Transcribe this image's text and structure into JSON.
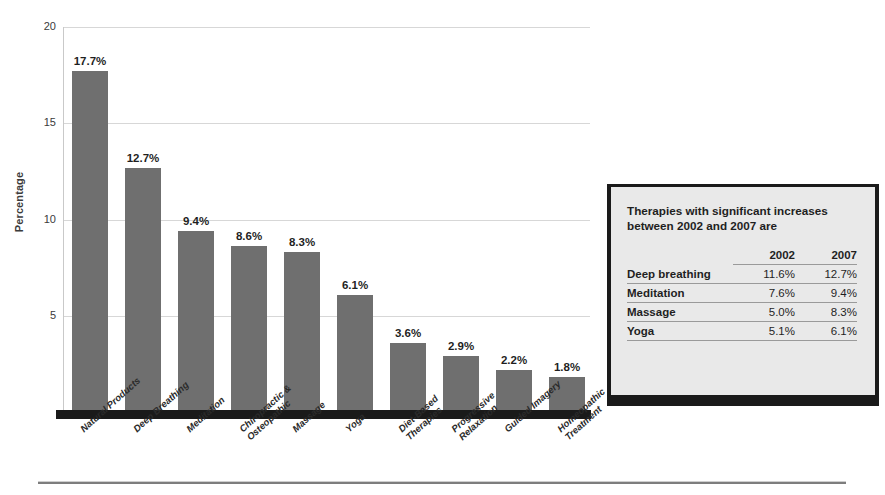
{
  "chart_data": {
    "type": "bar",
    "title": "",
    "xlabel": "",
    "ylabel": "Percentage",
    "ylim": [
      0,
      20
    ],
    "yticks": [
      5,
      10,
      15,
      20
    ],
    "grid": true,
    "legend": "none",
    "categories": [
      "Natural Products",
      "Deep Breathing",
      "Meditation",
      "Chiropractic &\nOsteopathic",
      "Massage",
      "Yoga",
      "Diet-Based\nTherapies",
      "Progressive\nRelaxation",
      "Guided Imagery",
      "Homeopathic\nTreatment"
    ],
    "values": [
      17.7,
      12.7,
      9.4,
      8.6,
      8.3,
      6.1,
      3.6,
      2.9,
      2.2,
      1.8
    ],
    "value_labels": [
      "17.7%",
      "12.7%",
      "9.4%",
      "8.6%",
      "8.3%",
      "6.1%",
      "3.6%",
      "2.9%",
      "2.2%",
      "1.8%"
    ],
    "bar_color": "#6f6f6f",
    "gridline_color": "#d7d7d7",
    "baseline_color": "#1a1a1a"
  },
  "axis": {
    "y_title": "Percentage",
    "ticks": [
      {
        "label": "20",
        "value": 20
      },
      {
        "label": "15",
        "value": 15
      },
      {
        "label": "10",
        "value": 10
      },
      {
        "label": "5",
        "value": 5
      }
    ]
  },
  "sidebox": {
    "title": "Therapies with significant increases between 2002 and 2007 are",
    "columns": [
      "",
      "2002",
      "2007"
    ],
    "rows": [
      {
        "name": "Deep breathing",
        "y2002": "11.6%",
        "y2007": "12.7%"
      },
      {
        "name": "Meditation",
        "y2002": "7.6%",
        "y2007": "9.4%"
      },
      {
        "name": "Massage",
        "y2002": "5.0%",
        "y2007": "8.3%"
      },
      {
        "name": "Yoga",
        "y2002": "5.1%",
        "y2007": "6.1%"
      }
    ],
    "background": "#e9e9e9",
    "border_color": "#1a1a1a"
  }
}
